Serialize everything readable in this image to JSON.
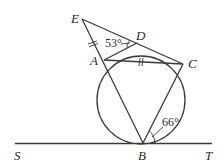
{
  "diagram": {
    "type": "geometry",
    "points": {
      "E": {
        "label": "E"
      },
      "D": {
        "label": "D"
      },
      "A": {
        "label": "A"
      },
      "C": {
        "label": "C"
      },
      "B": {
        "label": "B"
      },
      "S": {
        "label": "S"
      },
      "T": {
        "label": "T"
      }
    },
    "angles": {
      "EDA": {
        "value": "53°",
        "vertex": "D"
      },
      "CBT": {
        "value": "66°",
        "vertex": "B"
      }
    },
    "marks": {
      "equal_length": [
        "EA",
        "AC"
      ],
      "mark_style": "double-tick"
    },
    "segments": [
      "EA",
      "AB",
      "ED",
      "DC",
      "AD",
      "AC",
      "BC",
      "ST"
    ],
    "circle": {
      "through": [
        "A",
        "D",
        "C",
        "B"
      ],
      "tangent": "ST",
      "tangent_point": "B"
    }
  }
}
